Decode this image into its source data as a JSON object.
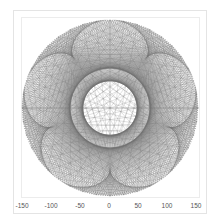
{
  "chart_data": {
    "type": "line",
    "title": "",
    "xlabel": "",
    "ylabel": "",
    "xlim": [
      -150,
      150
    ],
    "x_ticks": [
      -150,
      -100,
      -50,
      0,
      50,
      100,
      150
    ],
    "x_tick_labels": [
      "-150",
      "-100",
      "-50",
      "0",
      "50",
      "100",
      "150"
    ],
    "circle_radius": 150,
    "center": [
      0,
      0
    ],
    "grid": false,
    "legend": null,
    "line_color": "#6f6f6f",
    "chord_families": [
      {
        "name": "outer-ring",
        "points": 240,
        "step": 96
      },
      {
        "name": "mid-ring",
        "points": 240,
        "step": 84
      },
      {
        "name": "flower",
        "points": 240,
        "multiplier": 6
      }
    ]
  },
  "axis": {
    "ticks": [
      {
        "label": "-150",
        "x": 22
      },
      {
        "label": "-100",
        "x": 51
      },
      {
        "label": "-50",
        "x": 80
      },
      {
        "label": "0",
        "x": 109
      },
      {
        "label": "50",
        "x": 138
      },
      {
        "label": "100",
        "x": 167
      },
      {
        "label": "150",
        "x": 196
      }
    ]
  }
}
